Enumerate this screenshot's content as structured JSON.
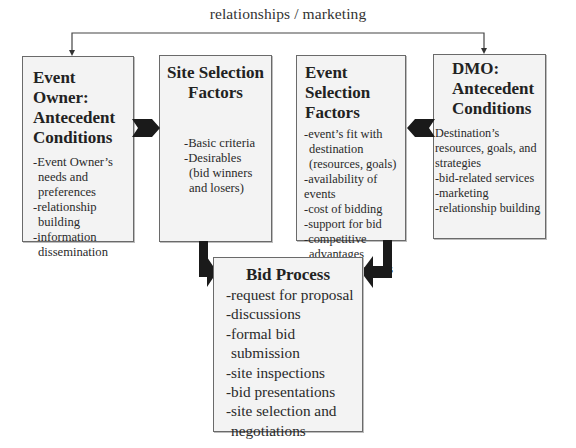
{
  "diagram": {
    "top_connector": {
      "label": "relationships / marketing",
      "from": "Event Owner: Antecedent Conditions",
      "to": "DMO: Antecedent Conditions",
      "style": "bidirectional line with arrowheads pointing down into both boxes"
    },
    "boxes": {
      "event_owner": {
        "title_lines": [
          "Event Owner:",
          "Antecedent",
          "Conditions"
        ],
        "items": [
          {
            "line1": "-Event Owner’s",
            "line2": "needs and",
            "line3": "preferences"
          },
          {
            "line1": "-relationship",
            "line2": "building"
          },
          {
            "line1": "-information",
            "line2": "dissemination"
          }
        ]
      },
      "site_selection": {
        "title_lines": [
          "Site Selection",
          "Factors"
        ],
        "items": [
          {
            "line1": "-Basic criteria"
          },
          {
            "line1": "-Desirables",
            "line2": "(bid winners",
            "line3": "and losers)"
          }
        ]
      },
      "event_selection": {
        "title_lines": [
          "Event Selection",
          "Factors"
        ],
        "items": [
          {
            "line1": "-event’s fit with",
            "line2": "destination",
            "line3": "(resources, goals)"
          },
          {
            "line1": "-availability of events"
          },
          {
            "line1": "-cost of bidding"
          },
          {
            "line1": "-support for bid"
          },
          {
            "line1": "-competitive",
            "line2": "advantages"
          },
          {
            "line1": "-potential impacts"
          }
        ]
      },
      "dmo": {
        "title_lines": [
          "DMO:",
          "Antecedent",
          "Conditions"
        ],
        "items": [
          {
            "line1": "Destination’s"
          },
          {
            "line1": "resources, goals, and"
          },
          {
            "line1": "strategies"
          },
          {
            "line1": "-bid-related services"
          },
          {
            "line1": "-marketing"
          },
          {
            "line1": "-relationship building"
          }
        ]
      },
      "bid_process": {
        "title_lines": [
          "Bid Process"
        ],
        "items": [
          {
            "line1": "-request for proposal"
          },
          {
            "line1": "-discussions"
          },
          {
            "line1": "-formal bid",
            "line2": "submission"
          },
          {
            "line1": "-site inspections"
          },
          {
            "line1": "-bid presentations"
          },
          {
            "line1": "-site selection and",
            "line2": "negotiations"
          }
        ]
      }
    },
    "arrows": [
      {
        "from": "Event Owner: Antecedent Conditions",
        "to": "Site Selection Factors",
        "shape": "chevron-right"
      },
      {
        "from": "DMO: Antecedent Conditions",
        "to": "Event Selection Factors",
        "shape": "chevron-left"
      },
      {
        "from": "Site Selection Factors",
        "to": "Bid Process",
        "shape": "bent-arrow-down-right"
      },
      {
        "from": "Event Selection Factors",
        "to": "Bid Process",
        "shape": "bent-arrow-down-left"
      }
    ],
    "colors": {
      "box_fill": "#f3f3f3",
      "box_border": "#6a6a6a",
      "arrow_fill": "#1a1a1a",
      "text": "#222222",
      "line": "#444444"
    }
  }
}
